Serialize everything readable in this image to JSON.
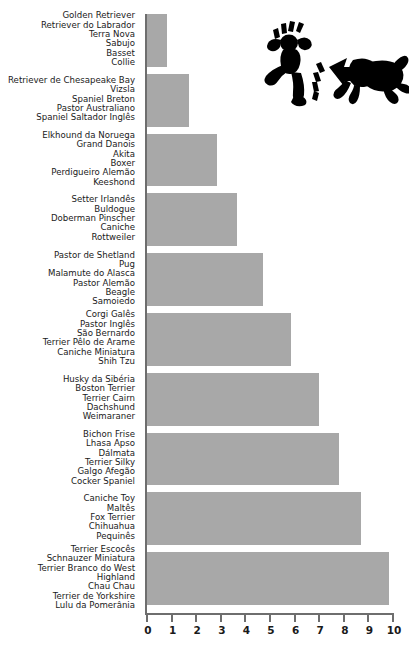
{
  "chart_data": {
    "type": "bar",
    "orientation": "horizontal",
    "title": "",
    "xlabel": "",
    "ylabel": "",
    "xlim": [
      0,
      10
    ],
    "xticks": [
      0,
      1,
      2,
      3,
      4,
      5,
      6,
      7,
      8,
      9,
      10
    ],
    "xtick_labels": [
      "0",
      "1",
      "2",
      "3",
      "4",
      "5",
      "6",
      "7",
      "8",
      "9",
      "10"
    ],
    "grid": false,
    "legend": null,
    "bar_color": "#a8a8a8",
    "axis_color": "#6e6e6e",
    "categories": [
      "Golden Retriever / Retriever do Labrador / Terra Nova / Sabujo / Basset / Collie",
      "Retriever de Chesapeake Bay / Vizsla / Spaniel Breton / Pastor Australiano / Spaniel Saltador Inglês",
      "Elkhound da Noruega / Grand Danois / Akita / Boxer / Perdigueiro Alemão / Keeshond",
      "Setter Irlandês / Buldogue / Doberman Pinscher / Caniche / Rottweiler",
      "Pastor de Shetland / Pug / Malamute do Alasca / Pastor Alemão / Beagle / Samoiedo",
      "Corgi Galês / Pastor Inglês / São Bernardo / Terrier Pêlo de Arame / Caniche Miniatura / Shih Tzu",
      "Husky da Sibéria / Boston Terrier / Terrier Cairn / Dachshund / Weimaraner",
      "Bichon Frise / Lhasa Apso / Dálmata / Terrier Silky / Galgo Afegão / Cocker Spaniel",
      "Caniche Toy / Maltês / Fox Terrier / Chihuahua / Pequinês",
      "Terrier Escocês / Schnauzer Miniatura / Terrier Branco do West / Highland / Chau Chau / Terrier de Yorkshire / Lulu da Pomerânia"
    ],
    "values": [
      0.8,
      1.7,
      2.85,
      3.65,
      4.7,
      5.85,
      7.0,
      7.8,
      8.7,
      9.85
    ],
    "groups": [
      {
        "labels": [
          "Golden Retriever",
          "Retriever do Labrador",
          "Terra Nova",
          "Sabujo",
          "Basset",
          "Collie"
        ],
        "value": 0.8
      },
      {
        "labels": [
          "Retriever de Chesapeake Bay",
          "Vizsla",
          "Spaniel Breton",
          "Pastor Australiano",
          "Spaniel Saltador Inglês"
        ],
        "value": 1.7
      },
      {
        "labels": [
          "Elkhound da Noruega",
          "Grand Danois",
          "Akita",
          "Boxer",
          "Perdigueiro Alemão",
          "Keeshond"
        ],
        "value": 2.85
      },
      {
        "labels": [
          "Setter Irlandês",
          "Buldogue",
          "Doberman Pinscher",
          "Caniche",
          "Rottweiler"
        ],
        "value": 3.65
      },
      {
        "labels": [
          "Pastor de Shetland",
          "Pug",
          "Malamute do Alasca",
          "Pastor Alemão",
          "Beagle",
          "Samoiedo"
        ],
        "value": 4.7
      },
      {
        "labels": [
          "Corgi Galês",
          "Pastor Inglês",
          "São Bernardo",
          "Terrier Pêlo de Arame",
          "Caniche Miniatura",
          "Shih Tzu"
        ],
        "value": 5.85
      },
      {
        "labels": [
          "Husky da Sibéria",
          "Boston Terrier",
          "Terrier Cairn",
          "Dachshund",
          "Weimaraner"
        ],
        "value": 7.0
      },
      {
        "labels": [
          "Bichon Frise",
          "Lhasa Apso",
          "Dálmata",
          "Terrier Silky",
          "Galgo Afegão",
          "Cocker Spaniel"
        ],
        "value": 7.8
      },
      {
        "labels": [
          "Caniche Toy",
          "Maltês",
          "Fox Terrier",
          "Chihuahua",
          "Pequinês"
        ],
        "value": 8.7
      },
      {
        "labels": [
          "Terrier Escocês",
          "Schnauzer Miniatura",
          "Terrier Branco do West",
          "Highland",
          "Chau Chau",
          "Terrier de Yorkshire",
          "Lulu da Pomerânia"
        ],
        "value": 9.85
      }
    ]
  },
  "illustration": {
    "name": "person-fleeing-barking-dog-icon",
    "description": "Black silhouette pictogram of a running person with motion marks and a barking dog"
  }
}
